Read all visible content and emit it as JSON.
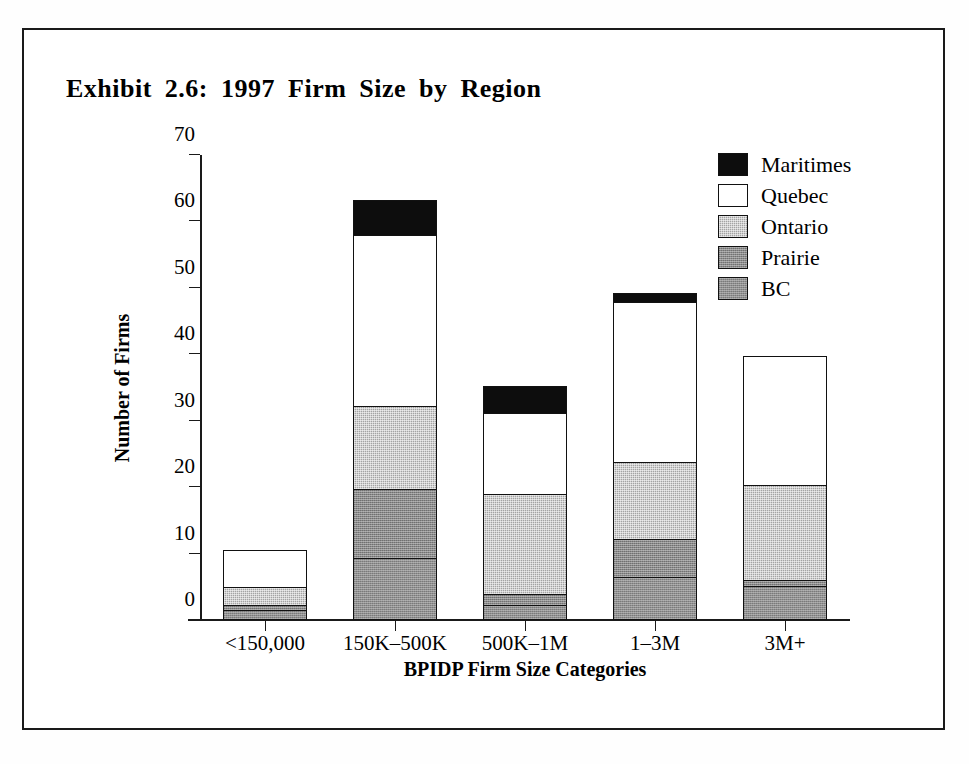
{
  "chart_data": {
    "type": "bar",
    "subtype": "stacked-bar",
    "title": "Exhibit 2.6:  1997 Firm Size by Region",
    "xlabel": "BPIDP Firm Size Categories",
    "ylabel": "Number of Firms",
    "categories": [
      "<150,000",
      "150K–500K",
      "500K–1M",
      "1–3M",
      "3M+"
    ],
    "ylim": [
      0,
      70
    ],
    "yticks": [
      0,
      10,
      20,
      30,
      40,
      50,
      60,
      70
    ],
    "ytick_labels": [
      "0",
      "10",
      "20",
      "30",
      "40",
      "50",
      "60",
      "70"
    ],
    "grid": false,
    "legend_position": "top-right",
    "stack_order_bottom_to_top": [
      "BC",
      "Prairie",
      "Ontario",
      "Quebec",
      "Maritimes"
    ],
    "series": [
      {
        "name": "BC",
        "color": "#8f8f8f",
        "values": [
          1.5,
          9.3,
          2.3,
          6.5,
          5.1
        ]
      },
      {
        "name": "Prairie",
        "color": "#8a8a8a",
        "values": [
          0.8,
          10.4,
          1.6,
          5.7,
          0.9
        ]
      },
      {
        "name": "Ontario",
        "color": "#a3a3a3",
        "values": [
          2.7,
          12.5,
          15.0,
          11.6,
          14.4
        ]
      },
      {
        "name": "Quebec",
        "color": "#ffffff",
        "values": [
          5.5,
          25.8,
          12.2,
          24.1,
          19.3
        ]
      },
      {
        "name": "Maritimes",
        "color": "#0d0d0d",
        "values": [
          0.0,
          5.3,
          4.2,
          1.3,
          0.0
        ]
      }
    ],
    "totals": [
      10.5,
      63.3,
      35.3,
      49.2,
      39.7
    ]
  },
  "legend": {
    "items": [
      {
        "label": "Maritimes",
        "swatch": "legend-swatch-maritimes"
      },
      {
        "label": "Quebec",
        "swatch": "legend-swatch-quebec"
      },
      {
        "label": "Ontario",
        "swatch": "legend-swatch-ontario"
      },
      {
        "label": "Prairie",
        "swatch": "legend-swatch-prairie"
      },
      {
        "label": "BC",
        "swatch": "legend-swatch-bc"
      }
    ]
  },
  "colors": {
    "maritimes": "#0d0d0d",
    "quebec": "#ffffff",
    "ontario": "#a3a3a3",
    "prairie": "#8a8a8a",
    "bc": "#8f8f8f",
    "axis": "#1a1a1a",
    "frame": "#1a1a1a",
    "background": "#ffffff"
  }
}
